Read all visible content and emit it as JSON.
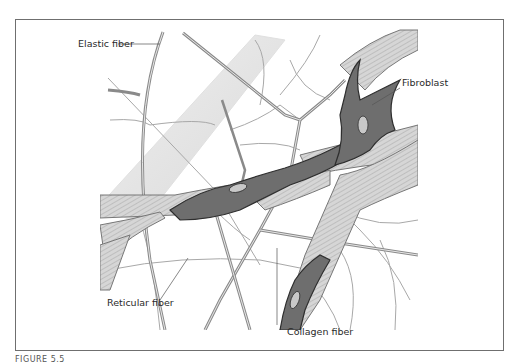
{
  "figure": {
    "labels": {
      "elastic_fiber": "Elastic fiber",
      "fibroblast": "Fibroblast",
      "reticular_fiber": "Reticular fiber",
      "collagen_fiber": "Collagen fiber"
    },
    "caption": "FIGURE 5.5",
    "colors": {
      "cell": "#6e6e6e",
      "cell_outline": "#2e2e2e",
      "collagen": "#cfcfcf",
      "collagen_stripes": "#9a9a9a",
      "elastic": "#8a8a8a",
      "reticular": "#a8a8a8",
      "frame": "#6f6f6f"
    }
  }
}
